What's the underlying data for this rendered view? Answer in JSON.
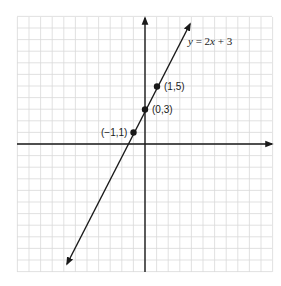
{
  "diagram": {
    "equation_label": {
      "prefix": "y",
      "rest": " = 2",
      "var": "x",
      "suffix": " + 3"
    },
    "equation": "y = 2x + 3",
    "points": [
      {
        "label": "(1,5)",
        "x": 1,
        "y": 5
      },
      {
        "label": "(0,3)",
        "x": 0,
        "y": 3
      },
      {
        "label": "(−1,1)",
        "x": -1,
        "y": 1
      }
    ],
    "grid": {
      "x_range": [
        -11,
        11
      ],
      "y_range": [
        -11,
        11
      ],
      "unit": 1
    },
    "colors": {
      "grid": "#d9d9d9",
      "ink": "#1a1a1a",
      "background": "#ffffff"
    }
  },
  "chart_data": {
    "type": "line",
    "title": "",
    "xlabel": "",
    "ylabel": "",
    "series": [
      {
        "name": "y = 2x + 3",
        "x": [
          -7,
          -1,
          0,
          1,
          4
        ],
        "values": [
          -11,
          1,
          3,
          5,
          11
        ]
      }
    ],
    "labeled_points": [
      {
        "label": "(−1,1)",
        "x": -1,
        "y": 1
      },
      {
        "label": "(0,3)",
        "x": 0,
        "y": 3
      },
      {
        "label": "(1,5)",
        "x": 1,
        "y": 5
      }
    ],
    "xlim": [
      -11,
      11
    ],
    "ylim": [
      -11,
      11
    ],
    "grid": true,
    "legend": "none",
    "annotations": [
      "y = 2x + 3"
    ]
  }
}
